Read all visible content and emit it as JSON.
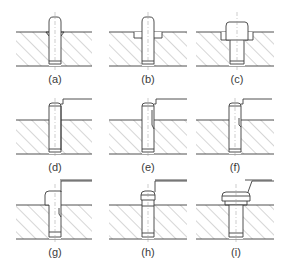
{
  "figure": {
    "colors": {
      "line": "#3c3c3c",
      "hatch": "#8a8a8a",
      "centerline": "#9a9a9a",
      "background": "#ffffff"
    },
    "panels": [
      {
        "id": "a",
        "label": "(a)",
        "variant": "pin-with-chamfer-seat"
      },
      {
        "id": "b",
        "label": "(b)",
        "variant": "pin-with-counterbore-recess"
      },
      {
        "id": "c",
        "label": "(c)",
        "variant": "stepped-head-in-counterbore"
      },
      {
        "id": "d",
        "label": "(d)",
        "variant": "pin-with-leader-line"
      },
      {
        "id": "e",
        "label": "(e)",
        "variant": "pin-with-flat-and-leader"
      },
      {
        "id": "f",
        "label": "(f)",
        "variant": "pin-with-short-flat-and-leader"
      },
      {
        "id": "g",
        "label": "(g)",
        "variant": "headed-pin-with-slot-and-leader"
      },
      {
        "id": "h",
        "label": "(h)",
        "variant": "pin-with-groove-and-leader"
      },
      {
        "id": "i",
        "label": "(i)",
        "variant": "flanged-head-with-leader"
      }
    ]
  }
}
